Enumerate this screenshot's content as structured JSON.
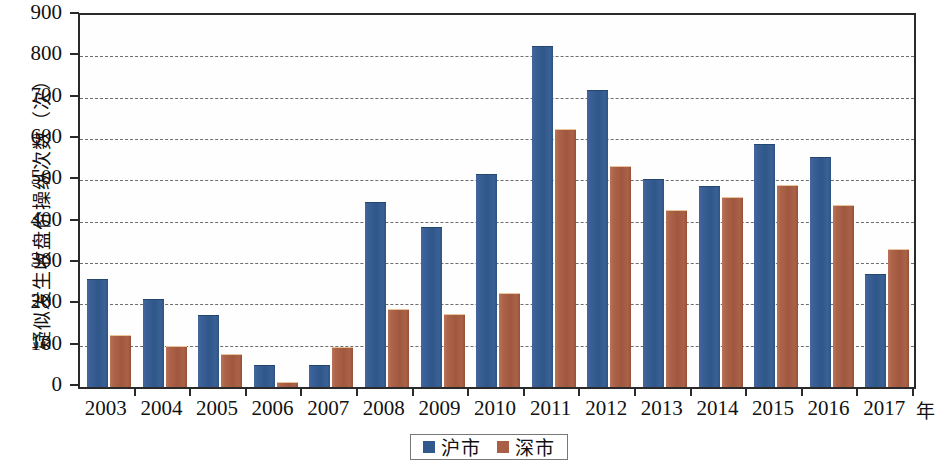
{
  "chart_data": {
    "type": "bar",
    "title": "",
    "xlabel": "年",
    "ylabel": "疑似发生收盘价操纵次数（次）",
    "categories": [
      "2003",
      "2004",
      "2005",
      "2006",
      "2007",
      "2008",
      "2009",
      "2010",
      "2011",
      "2012",
      "2013",
      "2014",
      "2015",
      "2016",
      "2017"
    ],
    "series": [
      {
        "name": "沪市",
        "color": "#31598e",
        "values": [
          259,
          210,
          172,
          52,
          52,
          445,
          384,
          514,
          823,
          717,
          500,
          485,
          586,
          553,
          272
        ]
      },
      {
        "name": "深市",
        "color": "#a85f45",
        "values": [
          123,
          97,
          77,
          10,
          95,
          187,
          175,
          224,
          622,
          533,
          425,
          458,
          486,
          437,
          332
        ]
      }
    ],
    "ylim": [
      0,
      900
    ],
    "yticks": [
      0,
      100,
      200,
      300,
      400,
      500,
      600,
      700,
      800,
      900
    ],
    "ytick_labels": [
      "0",
      "100",
      "200",
      "300",
      "400",
      "500",
      "600",
      "700",
      "800",
      "900"
    ],
    "grid": true,
    "legend_position": "bottom-center"
  },
  "axis": {
    "y_title": "疑似发生收盘价操纵次数（次）",
    "x_unit": "年"
  },
  "legend": {
    "items": [
      {
        "label": "沪市"
      },
      {
        "label": "深市"
      }
    ]
  }
}
